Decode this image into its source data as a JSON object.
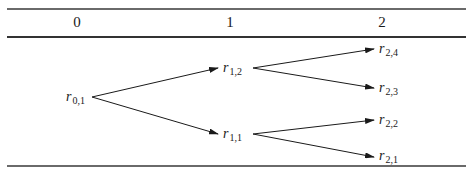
{
  "table": {
    "headers": [
      "0",
      "1",
      "2"
    ]
  },
  "tree": {
    "root": {
      "id": "r01",
      "base": "r",
      "sub": "0,1"
    },
    "level1": [
      {
        "id": "r12",
        "base": "r",
        "sub": "1,2"
      },
      {
        "id": "r11",
        "base": "r",
        "sub": "1,1"
      }
    ],
    "level2": [
      {
        "id": "r24",
        "base": "r",
        "sub": "2,4"
      },
      {
        "id": "r23",
        "base": "r",
        "sub": "2,3"
      },
      {
        "id": "r22",
        "base": "r",
        "sub": "2,2"
      },
      {
        "id": "r21",
        "base": "r",
        "sub": "2,1"
      }
    ],
    "edges": [
      [
        "r01",
        "r12"
      ],
      [
        "r01",
        "r11"
      ],
      [
        "r12",
        "r24"
      ],
      [
        "r12",
        "r23"
      ],
      [
        "r11",
        "r22"
      ],
      [
        "r11",
        "r21"
      ]
    ]
  },
  "colors": {
    "line": "#1a1a1a",
    "rule": "#555555"
  }
}
